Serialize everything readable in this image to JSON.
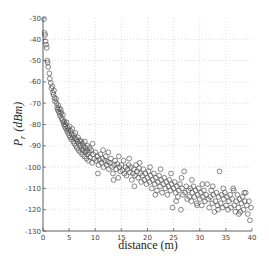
{
  "chart_data": {
    "type": "scatter",
    "title": "",
    "xlabel": "distance (m)",
    "ylabel": "P_r (dBm)",
    "ylabel_parts": {
      "main": "P",
      "sub": "r",
      "unit": "(dBm)"
    },
    "xlim": [
      0,
      40
    ],
    "ylim": [
      -130,
      -30
    ],
    "xticks": [
      0,
      5,
      10,
      15,
      20,
      25,
      30,
      35,
      40
    ],
    "yticks": [
      -30,
      -40,
      -50,
      -60,
      -70,
      -80,
      -90,
      -100,
      -110,
      -120,
      -130
    ],
    "grid": true,
    "legend": null,
    "marker": "open-circle",
    "marker_color": "#555555",
    "series": [
      {
        "name": "measured",
        "points": [
          [
            0.2,
            -30.5
          ],
          [
            0.3,
            -37
          ],
          [
            0.4,
            -38
          ],
          [
            0.5,
            -41
          ],
          [
            0.6,
            -42.5
          ],
          [
            0.7,
            -44
          ],
          [
            0.8,
            -50
          ],
          [
            0.9,
            -51
          ],
          [
            1.0,
            -53
          ],
          [
            1.2,
            -56
          ],
          [
            1.3,
            -58.5
          ],
          [
            1.5,
            -60.5
          ],
          [
            1.6,
            -63
          ],
          [
            1.8,
            -62
          ],
          [
            1.9,
            -65
          ],
          [
            2.0,
            -66
          ],
          [
            2.1,
            -64
          ],
          [
            2.2,
            -67.5
          ],
          [
            2.3,
            -69
          ],
          [
            2.5,
            -68
          ],
          [
            2.6,
            -70
          ],
          [
            2.7,
            -72
          ],
          [
            2.8,
            -73
          ],
          [
            2.9,
            -71
          ],
          [
            3.0,
            -74
          ],
          [
            3.1,
            -72.5
          ],
          [
            3.2,
            -75
          ],
          [
            3.3,
            -76
          ],
          [
            3.4,
            -73
          ],
          [
            3.5,
            -74.5
          ],
          [
            3.6,
            -77
          ],
          [
            3.7,
            -78
          ],
          [
            3.8,
            -75.5
          ],
          [
            3.9,
            -79
          ],
          [
            4.0,
            -80
          ],
          [
            4.1,
            -78.5
          ],
          [
            4.2,
            -81
          ],
          [
            4.3,
            -80
          ],
          [
            4.4,
            -82
          ],
          [
            4.5,
            -79
          ],
          [
            4.6,
            -83
          ],
          [
            4.7,
            -81.5
          ],
          [
            4.8,
            -84
          ],
          [
            4.9,
            -82.5
          ],
          [
            5.0,
            -85
          ],
          [
            5.1,
            -81
          ],
          [
            5.2,
            -86
          ],
          [
            5.3,
            -83
          ],
          [
            5.4,
            -87
          ],
          [
            5.5,
            -84.5
          ],
          [
            5.6,
            -82
          ],
          [
            5.7,
            -86
          ],
          [
            5.8,
            -88
          ],
          [
            5.9,
            -85
          ],
          [
            6.0,
            -89
          ],
          [
            6.1,
            -86.5
          ],
          [
            6.2,
            -84
          ],
          [
            6.3,
            -90
          ],
          [
            6.4,
            -87
          ],
          [
            6.5,
            -91
          ],
          [
            6.6,
            -88
          ],
          [
            6.7,
            -86
          ],
          [
            6.8,
            -92
          ],
          [
            6.9,
            -89
          ],
          [
            7.0,
            -87.5
          ],
          [
            7.1,
            -93
          ],
          [
            7.2,
            -90
          ],
          [
            7.3,
            -88
          ],
          [
            7.4,
            -91.5
          ],
          [
            7.5,
            -94
          ],
          [
            7.6,
            -89
          ],
          [
            7.7,
            -92
          ],
          [
            7.8,
            -90.5
          ],
          [
            7.9,
            -95
          ],
          [
            8.0,
            -88
          ],
          [
            8.1,
            -93
          ],
          [
            8.2,
            -91
          ],
          [
            8.3,
            -96
          ],
          [
            8.4,
            -92.5
          ],
          [
            8.5,
            -90
          ],
          [
            8.6,
            -94
          ],
          [
            8.7,
            -97
          ],
          [
            8.8,
            -93
          ],
          [
            8.9,
            -91
          ],
          [
            9.0,
            -95.5
          ],
          [
            9.2,
            -92
          ],
          [
            9.4,
            -98
          ],
          [
            9.6,
            -94
          ],
          [
            9.8,
            -96
          ],
          [
            10.0,
            -93
          ],
          [
            10.2,
            -97
          ],
          [
            10.4,
            -95
          ],
          [
            10.6,
            -99
          ],
          [
            10.8,
            -96.5
          ],
          [
            11.0,
            -94
          ],
          [
            11.2,
            -98
          ],
          [
            11.4,
            -96
          ],
          [
            11.6,
            -100
          ],
          [
            11.8,
            -97
          ],
          [
            12.0,
            -95
          ],
          [
            12.2,
            -99
          ],
          [
            12.4,
            -97.5
          ],
          [
            12.6,
            -101
          ],
          [
            12.8,
            -98
          ],
          [
            13.0,
            -96
          ],
          [
            13.2,
            -100
          ],
          [
            13.4,
            -103
          ],
          [
            13.6,
            -99
          ],
          [
            13.8,
            -97
          ],
          [
            14.0,
            -101
          ],
          [
            14.2,
            -98.5
          ],
          [
            14.4,
            -105
          ],
          [
            14.6,
            -100
          ],
          [
            14.8,
            -102
          ],
          [
            15.0,
            -99
          ],
          [
            15.2,
            -101.5
          ],
          [
            15.4,
            -97
          ],
          [
            15.6,
            -103
          ],
          [
            15.8,
            -100
          ],
          [
            16.0,
            -104
          ],
          [
            16.2,
            -101
          ],
          [
            16.4,
            -99
          ],
          [
            16.6,
            -102.5
          ],
          [
            16.8,
            -100
          ],
          [
            17.0,
            -106
          ],
          [
            17.2,
            -103
          ],
          [
            17.4,
            -101
          ],
          [
            17.6,
            -104
          ],
          [
            17.8,
            -99
          ],
          [
            18.0,
            -102
          ],
          [
            18.2,
            -105
          ],
          [
            18.4,
            -100.5
          ],
          [
            18.6,
            -103
          ],
          [
            18.8,
            -107
          ],
          [
            19.0,
            -104
          ],
          [
            19.2,
            -101
          ],
          [
            19.4,
            -106
          ],
          [
            19.6,
            -103
          ],
          [
            19.8,
            -108
          ],
          [
            20.0,
            -105
          ],
          [
            20.2,
            -102
          ],
          [
            20.4,
            -107
          ],
          [
            20.6,
            -104
          ],
          [
            20.8,
            -110
          ],
          [
            21.0,
            -106
          ],
          [
            21.2,
            -103
          ],
          [
            21.4,
            -108
          ],
          [
            21.6,
            -105
          ],
          [
            21.8,
            -111
          ],
          [
            22.0,
            -107
          ],
          [
            22.2,
            -104
          ],
          [
            22.4,
            -109
          ],
          [
            22.6,
            -106
          ],
          [
            22.8,
            -112
          ],
          [
            23.0,
            -108
          ],
          [
            23.2,
            -105
          ],
          [
            23.4,
            -110
          ],
          [
            23.6,
            -107
          ],
          [
            23.8,
            -113
          ],
          [
            24.0,
            -109
          ],
          [
            24.2,
            -106
          ],
          [
            24.4,
            -111
          ],
          [
            24.6,
            -108
          ],
          [
            24.8,
            -119
          ],
          [
            25.0,
            -110
          ],
          [
            25.2,
            -107
          ],
          [
            25.4,
            -112
          ],
          [
            25.6,
            -109
          ],
          [
            25.8,
            -114
          ],
          [
            26.0,
            -111
          ],
          [
            26.2,
            -108
          ],
          [
            26.4,
            -120
          ],
          [
            26.6,
            -110
          ],
          [
            26.8,
            -113
          ],
          [
            27.0,
            -102
          ],
          [
            27.2,
            -112
          ],
          [
            27.4,
            -109
          ],
          [
            27.6,
            -115
          ],
          [
            27.8,
            -111
          ],
          [
            28.0,
            -114
          ],
          [
            28.2,
            -110
          ],
          [
            28.4,
            -116
          ],
          [
            28.6,
            -112
          ],
          [
            28.8,
            -109
          ],
          [
            29.0,
            -114
          ],
          [
            29.2,
            -111
          ],
          [
            29.4,
            -117
          ],
          [
            29.6,
            -113
          ],
          [
            29.8,
            -110
          ],
          [
            30.0,
            -115
          ],
          [
            30.2,
            -112
          ],
          [
            30.4,
            -118
          ],
          [
            30.6,
            -114
          ],
          [
            30.8,
            -111
          ],
          [
            31.0,
            -116
          ],
          [
            31.2,
            -113
          ],
          [
            31.4,
            -108
          ],
          [
            31.6,
            -115
          ],
          [
            31.8,
            -119
          ],
          [
            32.0,
            -114
          ],
          [
            32.2,
            -111
          ],
          [
            32.4,
            -117
          ],
          [
            32.6,
            -113
          ],
          [
            32.8,
            -121
          ],
          [
            33.0,
            -116
          ],
          [
            33.2,
            -112
          ],
          [
            33.4,
            -118
          ],
          [
            33.6,
            -114
          ],
          [
            33.8,
            -102
          ],
          [
            34.0,
            -117
          ],
          [
            34.2,
            -113
          ],
          [
            34.4,
            -119
          ],
          [
            34.6,
            -115
          ],
          [
            34.8,
            -112
          ],
          [
            35.0,
            -118
          ],
          [
            35.2,
            -114
          ],
          [
            35.4,
            -120
          ],
          [
            35.6,
            -116
          ],
          [
            35.8,
            -113
          ],
          [
            36.0,
            -119
          ],
          [
            36.2,
            -115
          ],
          [
            36.4,
            -110
          ],
          [
            36.6,
            -118
          ],
          [
            36.8,
            -121
          ],
          [
            37.0,
            -116
          ],
          [
            37.2,
            -113
          ],
          [
            37.4,
            -119
          ],
          [
            37.6,
            -115
          ],
          [
            37.8,
            -121
          ],
          [
            38.0,
            -117
          ],
          [
            38.2,
            -114
          ],
          [
            38.4,
            -120
          ],
          [
            38.6,
            -116
          ],
          [
            38.8,
            -112
          ],
          [
            39.0,
            -118
          ],
          [
            39.2,
            -122
          ],
          [
            39.4,
            -116
          ],
          [
            39.6,
            -125
          ],
          [
            39.8,
            -119
          ],
          [
            9.5,
            -89
          ],
          [
            11.5,
            -92
          ],
          [
            12.5,
            -93
          ],
          [
            14.5,
            -95
          ],
          [
            16.5,
            -96
          ],
          [
            18.5,
            -98
          ],
          [
            20.5,
            -100
          ],
          [
            22.5,
            -101
          ],
          [
            24.5,
            -103
          ],
          [
            26.5,
            -105
          ],
          [
            28.5,
            -106
          ],
          [
            30.5,
            -108
          ],
          [
            32.5,
            -109
          ],
          [
            34.5,
            -110
          ],
          [
            36.5,
            -111
          ],
          [
            38.5,
            -112
          ],
          [
            10.5,
            -103
          ],
          [
            13.5,
            -106
          ],
          [
            17.5,
            -109
          ],
          [
            21.5,
            -113
          ],
          [
            25.5,
            -116
          ],
          [
            29.5,
            -118
          ],
          [
            33.5,
            -120
          ],
          [
            37.5,
            -122
          ]
        ]
      }
    ]
  },
  "axes": {
    "xlabel": "distance (m)",
    "ylabel_main": "P",
    "ylabel_sub": "r",
    "ylabel_unit": "(dBm)"
  }
}
